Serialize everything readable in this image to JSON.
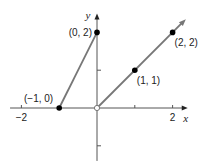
{
  "chart_data": {
    "type": "line",
    "title": "",
    "xlabel": "x",
    "ylabel": "y",
    "xlim": [
      -2.3,
      2.4
    ],
    "ylim": [
      -1.4,
      2.5
    ],
    "grid": false,
    "x_ticks": [
      {
        "value": -2,
        "label": "−2"
      },
      {
        "value": 1,
        "label": ""
      },
      {
        "value": 2,
        "label": "2"
      }
    ],
    "y_ticks": [
      {
        "value": 1,
        "label": ""
      },
      {
        "value": -1,
        "label": ""
      }
    ],
    "series": [
      {
        "name": "left-segment",
        "points": [
          [
            -1,
            0
          ],
          [
            0,
            2
          ]
        ],
        "endpoints": [
          "closed",
          "closed"
        ],
        "arrow": false
      },
      {
        "name": "right-ray",
        "points": [
          [
            0,
            0
          ],
          [
            2.35,
            2.35
          ]
        ],
        "endpoints": [
          "open",
          "arrow"
        ],
        "arrow": true
      }
    ],
    "labeled_points": [
      {
        "x": -1,
        "y": 0,
        "label": "(−1, 0)",
        "filled": true,
        "anchor": "above-left"
      },
      {
        "x": 0,
        "y": 2,
        "label": "(0, 2)",
        "filled": true,
        "anchor": "left"
      },
      {
        "x": 1,
        "y": 1,
        "label": "(1, 1)",
        "filled": true,
        "anchor": "below-right"
      },
      {
        "x": 2,
        "y": 2,
        "label": "(2, 2)",
        "filled": true,
        "anchor": "below-right"
      },
      {
        "x": 0,
        "y": 0,
        "label": "",
        "filled": false,
        "anchor": "none"
      }
    ],
    "colors": {
      "axis": "#555555",
      "line": "#777777",
      "point": "#000000"
    }
  }
}
